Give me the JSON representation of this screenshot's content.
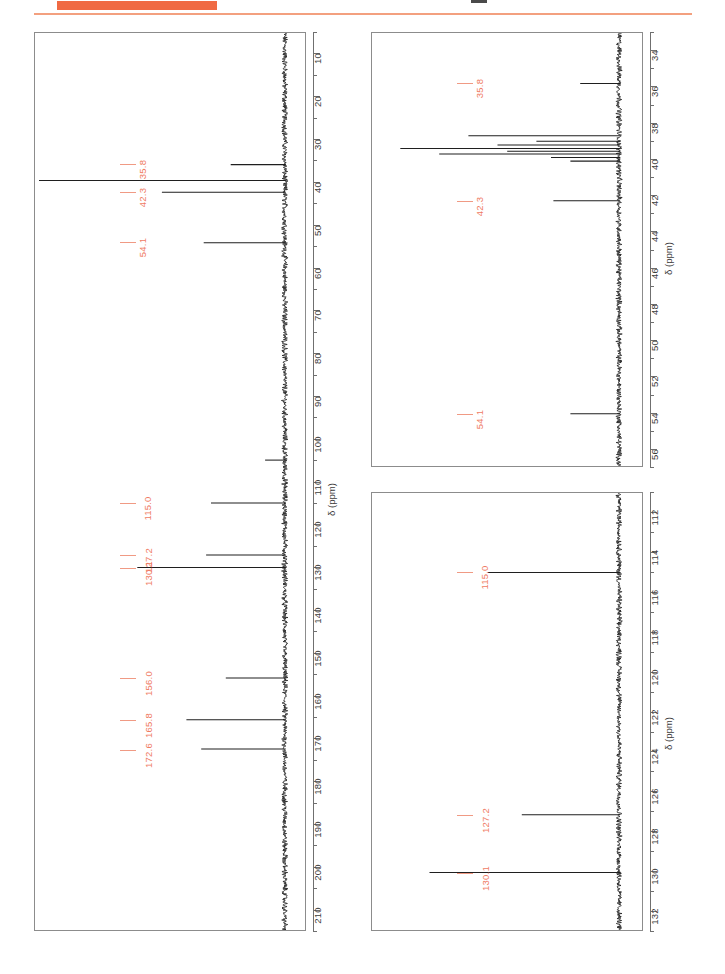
{
  "header": {
    "bar_color": "#f06a43",
    "rule_color": "#f3a07f",
    "crumb_text": ""
  },
  "axis_title": "δ (ppm)",
  "panels": [
    {
      "id": "panel-left",
      "name": "full-spectrum-panel",
      "axis_title": "δ (ppm)",
      "axis_min": 5,
      "axis_max": 215,
      "tick_step": 10,
      "minor_step": 5,
      "tick_labels": [
        10,
        20,
        30,
        40,
        50,
        60,
        70,
        80,
        90,
        100,
        110,
        120,
        130,
        140,
        150,
        160,
        170,
        180,
        190,
        200,
        210
      ],
      "peak_labels": [
        "35.8",
        "42.3",
        "54.1",
        "115.0",
        "127.2",
        "130.1",
        "156.0",
        "165.8",
        "172.6"
      ]
    },
    {
      "id": "panel-tr",
      "name": "aliphatic-expansion-panel",
      "axis_title": "δ (ppm)",
      "axis_min": 33,
      "axis_max": 57,
      "tick_step": 2,
      "minor_step": 1,
      "tick_labels": [
        34,
        36,
        38,
        40,
        42,
        44,
        46,
        48,
        50,
        52,
        54,
        56
      ],
      "peak_labels": [
        "35.8",
        "42.3",
        "54.1"
      ]
    },
    {
      "id": "panel-br",
      "name": "aromatic-expansion-panel",
      "axis_title": "δ (ppm)",
      "axis_min": 111,
      "axis_max": 133,
      "tick_step": 2,
      "minor_step": 1,
      "tick_labels": [
        112,
        114,
        116,
        118,
        120,
        122,
        124,
        126,
        128,
        130,
        132
      ],
      "peak_labels": [
        "115.0",
        "127.2",
        "130.1"
      ]
    }
  ],
  "chart_data": {
    "type": "line",
    "title": "",
    "subtitle": "",
    "xlabel": "",
    "ylabel": "δ (ppm)",
    "orientation": "vertical-axis-ppm",
    "legend": [],
    "grid": false,
    "spectra": [
      {
        "name": "13C NMR full spectrum",
        "panel": "panel-left",
        "axis_range_ppm": [
          5,
          215
        ],
        "axis_direction": "increasing-downward",
        "baseline_x_frac": 0.925,
        "solvent": "DMSO-d6 multiplet ~39.5 ppm",
        "peaks": [
          {
            "ppm": 172.6,
            "label": "172.6",
            "rel_intensity": 0.34,
            "labeled": true
          },
          {
            "ppm": 165.8,
            "label": "165.8",
            "rel_intensity": 0.4,
            "labeled": true
          },
          {
            "ppm": 156.0,
            "label": "156.0",
            "rel_intensity": 0.24,
            "labeled": true
          },
          {
            "ppm": 130.1,
            "label": "130.1",
            "rel_intensity": 0.6,
            "labeled": true
          },
          {
            "ppm": 127.2,
            "label": "127.2",
            "rel_intensity": 0.32,
            "labeled": true
          },
          {
            "ppm": 115.0,
            "label": "115.0",
            "rel_intensity": 0.3,
            "labeled": true
          },
          {
            "ppm": 105.0,
            "label": "",
            "rel_intensity": 0.08,
            "labeled": false
          },
          {
            "ppm": 54.1,
            "label": "54.1",
            "rel_intensity": 0.33,
            "labeled": true
          },
          {
            "ppm": 42.3,
            "label": "42.3",
            "rel_intensity": 0.5,
            "labeled": true
          },
          {
            "ppm": 39.5,
            "label": "",
            "rel_intensity": 1.0,
            "labeled": false
          },
          {
            "ppm": 35.8,
            "label": "35.8",
            "rel_intensity": 0.22,
            "labeled": true
          }
        ]
      },
      {
        "name": "13C NMR aliphatic expansion",
        "panel": "panel-tr",
        "axis_range_ppm": [
          33,
          57
        ],
        "axis_direction": "increasing-downward",
        "baseline_x_frac": 0.915,
        "solvent": "DMSO-d6 multiplet ~39.5 ppm",
        "peaks": [
          {
            "ppm": 35.8,
            "label": "35.8",
            "rel_intensity": 0.16,
            "labeled": true
          },
          {
            "ppm": 38.7,
            "label": "",
            "rel_intensity": 0.62,
            "labeled": false
          },
          {
            "ppm": 39.0,
            "label": "",
            "rel_intensity": 0.34,
            "labeled": false
          },
          {
            "ppm": 39.2,
            "label": "",
            "rel_intensity": 0.5,
            "labeled": false
          },
          {
            "ppm": 39.4,
            "label": "",
            "rel_intensity": 0.9,
            "labeled": false
          },
          {
            "ppm": 39.55,
            "label": "",
            "rel_intensity": 0.46,
            "labeled": false
          },
          {
            "ppm": 39.7,
            "label": "",
            "rel_intensity": 0.74,
            "labeled": false
          },
          {
            "ppm": 39.9,
            "label": "",
            "rel_intensity": 0.28,
            "labeled": false
          },
          {
            "ppm": 40.1,
            "label": "",
            "rel_intensity": 0.2,
            "labeled": false
          },
          {
            "ppm": 42.3,
            "label": "42.3",
            "rel_intensity": 0.27,
            "labeled": true
          },
          {
            "ppm": 54.1,
            "label": "54.1",
            "rel_intensity": 0.2,
            "labeled": true
          }
        ]
      },
      {
        "name": "13C NMR aromatic expansion",
        "panel": "panel-br",
        "axis_range_ppm": [
          111,
          133
        ],
        "axis_direction": "increasing-downward",
        "baseline_x_frac": 0.915,
        "solvent": "",
        "peaks": [
          {
            "ppm": 115.0,
            "label": "115.0",
            "rel_intensity": 0.54,
            "labeled": true
          },
          {
            "ppm": 127.2,
            "label": "127.2",
            "rel_intensity": 0.4,
            "labeled": true
          },
          {
            "ppm": 130.1,
            "label": "130.1",
            "rel_intensity": 0.78,
            "labeled": true
          }
        ]
      }
    ]
  }
}
